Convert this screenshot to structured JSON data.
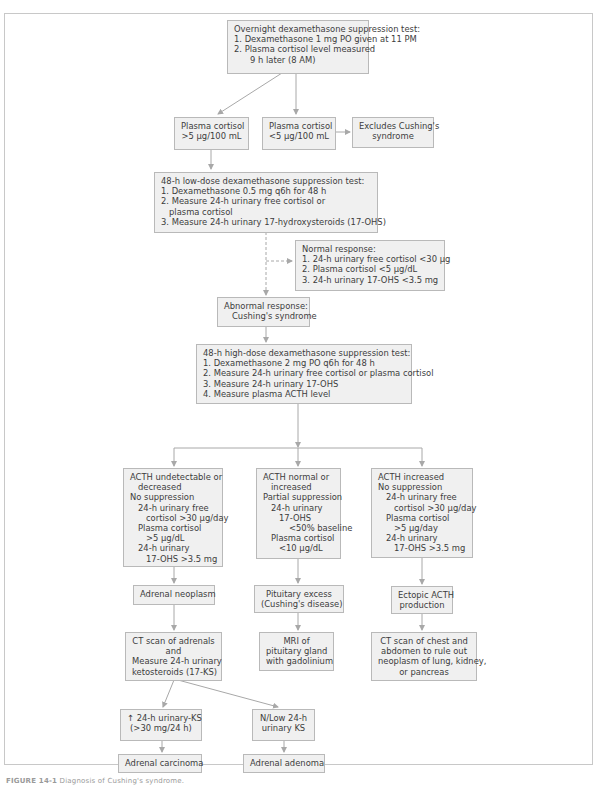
{
  "figure": {
    "caption_label": "FIGURE 14-1",
    "caption_text": "Diagnosis of Cushing's syndrome."
  },
  "colors": {
    "box_fill": "#f0f0f0",
    "box_border": "#b9b9b9",
    "connector": "#a8a8a8",
    "text": "#3c3c3c"
  },
  "nodes": {
    "overnight": {
      "lines": [
        "Overnight dexamethasone suppression test:",
        "1. Dexamethasone 1 mg PO given at 11 PM",
        "2. Plasma cortisol level measured",
        "    9 h later (8 AM)"
      ]
    },
    "cortisol_high": {
      "lines": [
        "Plasma cortisol",
        ">5 μg/100 mL"
      ]
    },
    "cortisol_low": {
      "lines": [
        "Plasma cortisol",
        "<5 μg/100 mL"
      ]
    },
    "excludes": {
      "lines": [
        "Excludes Cushing's",
        "syndrome"
      ]
    },
    "low_dose": {
      "lines": [
        "48-h low-dose dexamethasone suppression test:",
        "1. Dexamethasone 0.5 mg q6h for 48 h",
        "2. Measure 24-h urinary free cortisol or",
        "    plasma cortisol",
        "3. Measure 24-h urinary 17-hydroxysteroids (17-OHS)"
      ]
    },
    "normal_response": {
      "lines": [
        "Normal response:",
        "1. 24-h urinary free cortisol <30 μg",
        "2. Plasma cortisol <5 μg/dL",
        "3. 24-h urinary 17-OHS <3.5 mg"
      ]
    },
    "abnormal_response": {
      "lines": [
        "Abnormal response:",
        "Cushing's syndrome"
      ]
    },
    "high_dose": {
      "lines": [
        "48-h high-dose dexamethasone suppression test:",
        "1. Dexamethasone 2 mg PO q6h for 48 h",
        "2. Measure 24-h urinary free cortisol or plasma cortisol",
        "3. Measure 24-h urinary 17-OHS",
        "4. Measure plasma ACTH level"
      ]
    },
    "acth_low": {
      "lines": [
        "ACTH undetectable or",
        "decreased",
        "No suppression",
        "24-h urinary free",
        "cortisol >30 μg/day",
        "Plasma cortisol",
        ">5 μg/dL",
        "24-h urinary",
        "17-OHS >3.5 mg"
      ]
    },
    "acth_normal": {
      "lines": [
        "ACTH normal or",
        "increased",
        "Partial suppression",
        "24-h urinary",
        "17-OHS",
        "<50% baseline",
        "Plasma cortisol",
        "<10 μg/dL"
      ]
    },
    "acth_high": {
      "lines": [
        "ACTH increased",
        "No suppression",
        "24-h urinary free",
        "cortisol >30 μg/day",
        "Plasma cortisol",
        ">5 μg/day",
        "24-h urinary",
        "17-OHS >3.5 mg"
      ]
    },
    "adrenal_neoplasm": {
      "lines": [
        "Adrenal neoplasm"
      ]
    },
    "pituitary_excess": {
      "lines": [
        "Pituitary excess",
        "(Cushing's disease)"
      ]
    },
    "ectopic_acth": {
      "lines": [
        "Ectopic ACTH",
        "production"
      ]
    },
    "ct_adrenals": {
      "lines": [
        "CT scan of adrenals",
        "and",
        "Measure 24-h urinary",
        "ketosteroids (17-KS)"
      ]
    },
    "mri_pituitary": {
      "lines": [
        "MRI of",
        "pituitary gland",
        "with gadolinium"
      ]
    },
    "ct_chest": {
      "lines": [
        "CT scan of chest and",
        "abdomen to rule out",
        "neoplasm of lung, kidney,",
        "or pancreas"
      ]
    },
    "ks_high": {
      "lines": [
        "↑ 24-h urinary-KS",
        "(>30 mg/24 h)"
      ]
    },
    "ks_low": {
      "lines": [
        "N/Low 24-h",
        "urinary KS"
      ]
    },
    "adrenal_carcinoma": {
      "lines": [
        "Adrenal carcinoma"
      ]
    },
    "adrenal_adenoma": {
      "lines": [
        "Adrenal adenoma"
      ]
    }
  }
}
